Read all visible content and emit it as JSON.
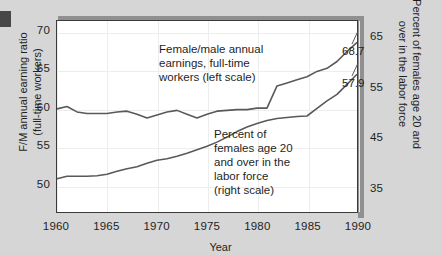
{
  "figure": {
    "background_color": "#d6d6d6",
    "plot_background_color": "#ffffff",
    "frame_color": "#3a3a3a",
    "shadow_color": "#909090",
    "line_color": "#595959"
  },
  "chart_data": {
    "type": "line",
    "title": "",
    "xlabel": "Year",
    "ylabel": "F/M annual earning ratio\n(full-time workers)",
    "y2label": "Percent of females age 20 and\nover in the labor force",
    "xlim": [
      1960,
      1990
    ],
    "ylim": [
      46.5,
      71.5
    ],
    "y2lim": [
      30.5,
      68.5
    ],
    "xticks": [
      1960,
      1965,
      1970,
      1975,
      1980,
      1985,
      1990
    ],
    "xticklabels": [
      "1960",
      "1965",
      "1970",
      "1975",
      "1980",
      "1985",
      "1990"
    ],
    "yticks": [
      50,
      55,
      60,
      65,
      70
    ],
    "yticklabels": [
      "50",
      "55",
      "60",
      "65",
      "70"
    ],
    "y2ticks": [
      35,
      45,
      55,
      65
    ],
    "y2ticklabels": [
      "35",
      "45",
      "55",
      "65"
    ],
    "grid": true,
    "legend": "none",
    "series": [
      {
        "name": "Female/male annual earnings, full-time workers (left scale)",
        "axis": "left",
        "end_value_label": "68.7",
        "x": [
          1960,
          1961,
          1962,
          1963,
          1964,
          1965,
          1966,
          1967,
          1968,
          1969,
          1970,
          1971,
          1972,
          1973,
          1974,
          1975,
          1976,
          1977,
          1978,
          1979,
          1980,
          1981,
          1982,
          1983,
          1984,
          1985,
          1986,
          1987,
          1988,
          1989,
          1990
        ],
        "values": [
          60.0,
          60.3,
          59.6,
          59.4,
          59.4,
          59.4,
          59.6,
          59.7,
          59.3,
          58.8,
          59.2,
          59.6,
          59.8,
          59.3,
          58.8,
          59.3,
          59.7,
          59.8,
          59.9,
          59.9,
          60.1,
          60.1,
          63.0,
          63.4,
          63.8,
          64.2,
          64.9,
          65.3,
          66.2,
          67.5,
          68.7
        ]
      },
      {
        "name": "Percent of females age 20 and over in the labor force (right scale)",
        "axis": "right",
        "end_value_label": "57.9",
        "x": [
          1960,
          1961,
          1962,
          1963,
          1964,
          1965,
          1966,
          1967,
          1968,
          1969,
          1970,
          1971,
          1972,
          1973,
          1974,
          1975,
          1976,
          1977,
          1978,
          1979,
          1980,
          1981,
          1982,
          1983,
          1984,
          1985,
          1986,
          1987,
          1988,
          1989,
          1990
        ],
        "values": [
          37.1,
          37.6,
          37.6,
          37.6,
          37.7,
          38.0,
          38.6,
          39.1,
          39.5,
          40.2,
          40.8,
          41.1,
          41.6,
          42.2,
          42.9,
          43.6,
          44.4,
          45.4,
          46.5,
          47.4,
          48.1,
          48.7,
          49.1,
          49.3,
          49.5,
          49.6,
          51.1,
          52.6,
          53.9,
          55.9,
          57.9
        ]
      }
    ],
    "annotations": [
      {
        "name": "upper-series-annotation",
        "text": "Female/male annual\nearnings, full-time\nworkers (left scale)"
      },
      {
        "name": "lower-series-annotation",
        "text": "Percent of\nfemales age 20\nand over in the\nlabor force\n(right scale)"
      }
    ]
  }
}
